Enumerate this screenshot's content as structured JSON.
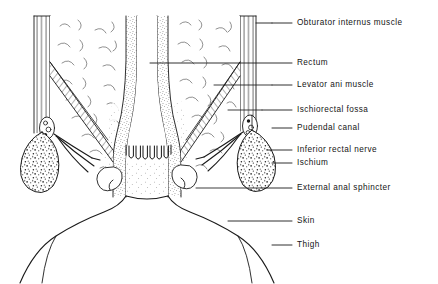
{
  "figure": {
    "background_color": "#ffffff",
    "ink_color": "#1a1a1a",
    "width": 438,
    "height": 284
  },
  "labels": [
    {
      "id": "obturator-internus-muscle",
      "text": "Obturator internus muscle",
      "x": 297,
      "y": 23,
      "leader": {
        "x1": 272,
        "y1": 23,
        "x2": 292,
        "y2": 23
      }
    },
    {
      "id": "rectum",
      "text": "Rectum",
      "x": 297,
      "y": 63,
      "leader": {
        "x1": 150,
        "y1": 63,
        "x2": 292,
        "y2": 63
      }
    },
    {
      "id": "levator-ani-muscle",
      "text": "Levator ani muscle",
      "x": 297,
      "y": 85,
      "leader": {
        "x1": 272,
        "y1": 85,
        "x2": 292,
        "y2": 85
      }
    },
    {
      "id": "ischiorectal-fossa",
      "text": "Ischiorectal fossa",
      "x": 297,
      "y": 110,
      "leader": {
        "x1": 262,
        "y1": 110,
        "x2": 292,
        "y2": 110
      }
    },
    {
      "id": "pudendal-canal",
      "text": "Pudendal canal",
      "x": 297,
      "y": 128,
      "leader": {
        "x1": 272,
        "y1": 128,
        "x2": 292,
        "y2": 128
      }
    },
    {
      "id": "inferior-rectal-nerve",
      "text": "Inferior rectal nerve",
      "x": 297,
      "y": 150,
      "leader": {
        "x1": 268,
        "y1": 150,
        "x2": 292,
        "y2": 150
      }
    },
    {
      "id": "ischium",
      "text": "Ischium",
      "x": 297,
      "y": 163,
      "leader": {
        "x1": 272,
        "y1": 163,
        "x2": 292,
        "y2": 163
      }
    },
    {
      "id": "external-anal-sphincter",
      "text": "External anal sphincter",
      "x": 297,
      "y": 188,
      "leader": {
        "x1": 262,
        "y1": 188,
        "x2": 292,
        "y2": 188
      }
    },
    {
      "id": "skin",
      "text": "Skin",
      "x": 297,
      "y": 221,
      "leader": {
        "x1": 228,
        "y1": 221,
        "x2": 292,
        "y2": 221
      }
    },
    {
      "id": "thigh",
      "text": "Thigh",
      "x": 297,
      "y": 245,
      "leader": {
        "x1": 272,
        "y1": 245,
        "x2": 292,
        "y2": 245
      }
    }
  ],
  "structures": [
    {
      "id": "rectum-lumen",
      "name": "Rectum lumen"
    },
    {
      "id": "rectal-wall-left",
      "name": "Left rectal wall (stippled mucosa)"
    },
    {
      "id": "rectal-wall-right",
      "name": "Right rectal wall (stippled mucosa)"
    },
    {
      "id": "anal-columns",
      "name": "Anal columns"
    },
    {
      "id": "anal-canal",
      "name": "Anal canal"
    },
    {
      "id": "levator-ani-left",
      "name": "Left levator ani muscle sheet"
    },
    {
      "id": "levator-ani-right",
      "name": "Right levator ani muscle sheet"
    },
    {
      "id": "obturator-internus-left",
      "name": "Left obturator internus muscle"
    },
    {
      "id": "obturator-internus-right",
      "name": "Right obturator internus muscle"
    },
    {
      "id": "ischiorectal-fossa-left",
      "name": "Left ischiorectal fossa fat"
    },
    {
      "id": "ischiorectal-fossa-right",
      "name": "Right ischiorectal fossa fat"
    },
    {
      "id": "ischium-left",
      "name": "Left ischium (cancellous bone)"
    },
    {
      "id": "ischium-right",
      "name": "Right ischium (cancellous bone)"
    },
    {
      "id": "pudendal-canal-left",
      "name": "Left pudendal canal"
    },
    {
      "id": "pudendal-canal-right",
      "name": "Right pudendal canal"
    },
    {
      "id": "inferior-rectal-nerve-left",
      "name": "Left inferior rectal nerve"
    },
    {
      "id": "inferior-rectal-nerve-right",
      "name": "Right inferior rectal nerve"
    },
    {
      "id": "external-anal-sphincter",
      "name": "External anal sphincter"
    },
    {
      "id": "perineal-skin",
      "name": "Perineal skin outline"
    },
    {
      "id": "thigh-left",
      "name": "Left thigh"
    },
    {
      "id": "thigh-right",
      "name": "Right thigh"
    }
  ]
}
